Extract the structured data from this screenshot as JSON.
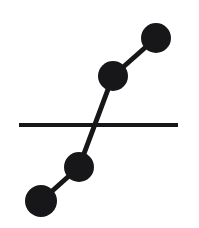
{
  "figure": {
    "width": 199,
    "height": 228,
    "background_color": "#ffffff",
    "ink_color": "#17171a"
  },
  "chart_data": {
    "type": "scatter",
    "title": "",
    "xlabel": "",
    "ylabel": "",
    "xlim": [
      0,
      199
    ],
    "ylim": [
      228,
      0
    ],
    "grid": false,
    "legend": null,
    "series": [
      {
        "name": "node-chain",
        "marker": "filled-circle",
        "color": "#17171a",
        "linewidth": 5,
        "points": [
          {
            "id": "node-1",
            "label": "bottom-left",
            "x": 41,
            "y": 201,
            "r": 16
          },
          {
            "id": "node-2",
            "label": "lower-middle",
            "x": 79,
            "y": 167,
            "r": 15
          },
          {
            "id": "node-3",
            "label": "upper-middle",
            "x": 113,
            "y": 76,
            "r": 15
          },
          {
            "id": "node-4",
            "label": "top-right",
            "x": 156,
            "y": 38,
            "r": 15
          }
        ],
        "links": [
          {
            "id": "link-1-2",
            "from": "node-1",
            "to": "node-2"
          },
          {
            "id": "link-2-3",
            "from": "node-2",
            "to": "node-3"
          },
          {
            "id": "link-3-4",
            "from": "node-3",
            "to": "node-4"
          }
        ]
      },
      {
        "name": "horizontal-reference-line",
        "marker": "none",
        "color": "#17171a",
        "linewidth": 4,
        "x1": 19,
        "y1": 125,
        "x2": 178,
        "y2": 125
      }
    ],
    "annotations": [
      {
        "id": "crossing-point",
        "x": 97,
        "y": 125,
        "text": ""
      }
    ]
  }
}
